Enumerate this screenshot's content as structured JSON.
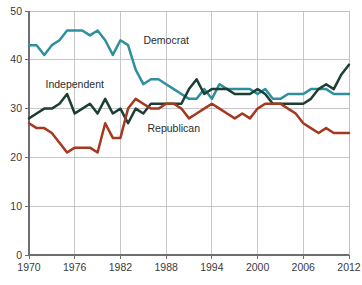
{
  "chart_data": {
    "type": "line",
    "title": "",
    "subtitle": "",
    "xlabel": "",
    "ylabel": "",
    "xlim": [
      1970,
      2012
    ],
    "ylim": [
      0,
      50
    ],
    "grid": true,
    "legend_position": "inline-annotations",
    "x_ticks": [
      "1970",
      "1976",
      "1982",
      "1988",
      "1994",
      "2000",
      "2006",
      "2012"
    ],
    "x_tick_values": [
      1970,
      1976,
      1982,
      1988,
      1994,
      2000,
      2006,
      2012
    ],
    "y_ticks": [
      "0",
      "10",
      "20",
      "30",
      "40",
      "50"
    ],
    "y_tick_values": [
      0,
      10,
      20,
      30,
      40,
      50
    ],
    "x": [
      1970,
      1971,
      1972,
      1973,
      1974,
      1975,
      1976,
      1977,
      1978,
      1979,
      1980,
      1981,
      1982,
      1983,
      1984,
      1985,
      1986,
      1987,
      1988,
      1989,
      1990,
      1991,
      1992,
      1993,
      1994,
      1995,
      1996,
      1997,
      1998,
      1999,
      2000,
      2001,
      2002,
      2003,
      2004,
      2005,
      2006,
      2007,
      2008,
      2009,
      2010,
      2011,
      2012
    ],
    "series": [
      {
        "name": "Democrat",
        "color": "#2E8F9E",
        "label": "Democrat",
        "label_x": 1988,
        "label_y": 44,
        "values": [
          43,
          43,
          41,
          43,
          44,
          46,
          46,
          46,
          45,
          46,
          44,
          41,
          44,
          43,
          38,
          35,
          36,
          36,
          35,
          34,
          33,
          32,
          32,
          34,
          32,
          35,
          34,
          34,
          34,
          34,
          33,
          34,
          32,
          32,
          33,
          33,
          33,
          34,
          34,
          34,
          33,
          33,
          33
        ]
      },
      {
        "name": "Independent",
        "color": "#1D3F33",
        "label": "Independent",
        "label_x": 1976,
        "label_y": 35,
        "values": [
          28,
          29,
          30,
          30,
          31,
          33,
          29,
          30,
          31,
          29,
          32,
          29,
          30,
          27,
          30,
          29,
          31,
          31,
          31,
          31,
          31,
          34,
          36,
          33,
          34,
          34,
          34,
          33,
          33,
          33,
          34,
          33,
          31,
          31,
          31,
          31,
          31,
          32,
          34,
          35,
          34,
          37,
          39
        ]
      },
      {
        "name": "Republican",
        "color": "#A5381F",
        "label": "Republican",
        "label_x": 1989,
        "label_y": 26,
        "values": [
          27,
          26,
          26,
          25,
          23,
          21,
          22,
          22,
          22,
          21,
          27,
          24,
          24,
          30,
          32,
          31,
          30,
          30,
          31,
          31,
          30,
          28,
          29,
          30,
          31,
          30,
          29,
          28,
          29,
          28,
          30,
          31,
          31,
          31,
          30,
          29,
          27,
          26,
          25,
          26,
          25,
          25,
          25
        ]
      }
    ]
  },
  "geometry": {
    "plot_left": 29,
    "plot_right": 349,
    "plot_top": 11,
    "plot_bottom": 255
  }
}
